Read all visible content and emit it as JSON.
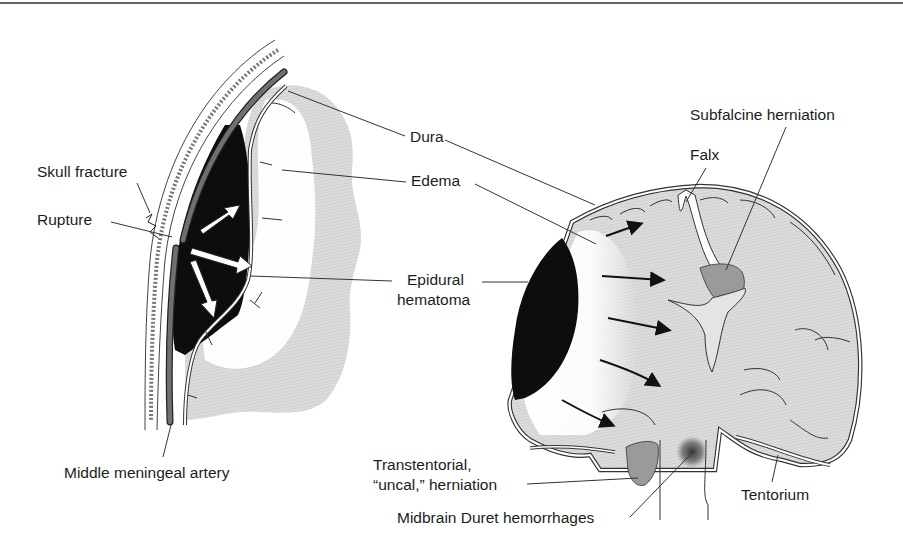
{
  "figure": {
    "top_rule": true,
    "colors": {
      "hematoma": "#0d0d0d",
      "brain": "#d4d4d4",
      "edema": "#ffffff",
      "herniation": "#9a9a9a",
      "artery": "#6e6e6e",
      "outline": "#222222"
    }
  },
  "left_panel": {
    "labels": {
      "skull_fracture": "Skull fracture",
      "rupture": "Rupture",
      "middle_meningeal_artery": "Middle meningeal artery"
    }
  },
  "center_labels": {
    "dura": "Dura",
    "edema": "Edema",
    "epidural_line1": "Epidural",
    "epidural_line2": "hematoma"
  },
  "right_panel": {
    "labels": {
      "subfalcine": "Subfalcine herniation",
      "falx": "Falx",
      "transtentorial_line1": "Transtentorial,",
      "transtentorial_line2": "“uncal,” herniation",
      "duret": "Midbrain Duret hemorrhages",
      "tentorium": "Tentorium"
    }
  }
}
